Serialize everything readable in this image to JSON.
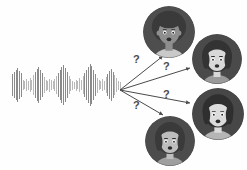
{
  "scene": {
    "title": "speaker-diarization-illustration",
    "canvas": {
      "width": 247,
      "height": 170,
      "background": "#ffffff"
    }
  },
  "waveform": {
    "label": "audio-waveform",
    "bar_color": "#8a8a8a",
    "bar_color_light": "#b8b8b8",
    "x": 12,
    "y": 85,
    "width": 106,
    "max_height": 42,
    "bar_count": 62,
    "bar_heights": [
      22,
      26,
      30,
      34,
      28,
      24,
      10,
      8,
      12,
      9,
      14,
      10,
      20,
      26,
      32,
      36,
      30,
      24,
      16,
      11,
      9,
      13,
      10,
      8,
      12,
      18,
      24,
      30,
      36,
      40,
      34,
      26,
      18,
      12,
      9,
      7,
      11,
      8,
      14,
      10,
      18,
      24,
      30,
      36,
      42,
      38,
      30,
      22,
      15,
      10,
      8,
      12,
      9,
      16,
      22,
      28,
      32,
      26,
      20,
      14,
      9,
      7
    ]
  },
  "arrows": {
    "label": "prediction-arrows",
    "color": "#4a4a4a",
    "origin": {
      "x": 120,
      "y": 90
    },
    "items": [
      {
        "name": "arrow-to-speaker-1",
        "to_x": 163,
        "to_y": 56,
        "marker": "?",
        "marker_x": 133,
        "marker_y": 54
      },
      {
        "name": "arrow-to-speaker-2",
        "to_x": 190,
        "to_y": 68,
        "marker": "?",
        "marker_x": 163,
        "marker_y": 61
      },
      {
        "name": "arrow-to-speaker-3",
        "to_x": 190,
        "to_y": 103,
        "marker": "?",
        "marker_x": 163,
        "marker_y": 89
      },
      {
        "name": "arrow-to-speaker-4",
        "to_x": 163,
        "to_y": 115,
        "marker": "?",
        "marker_x": 133,
        "marker_y": 100
      }
    ]
  },
  "speakers": [
    {
      "name": "speaker-avatar-1",
      "x": 143,
      "y": 6,
      "size": 52,
      "hair": "afro",
      "hair_color": "#3a3a3a",
      "skin_color": "#8e8e8e",
      "shirt_color": "#c9c9c9",
      "bg_color": "#4e4e4e"
    },
    {
      "name": "speaker-avatar-2",
      "x": 192,
      "y": 34,
      "size": 50,
      "hair": "bob",
      "hair_color": "#333333",
      "skin_color": "#d8d8d8",
      "shirt_color": "#9a9a9a",
      "bg_color": "#4a4a4a"
    },
    {
      "name": "speaker-avatar-3",
      "x": 192,
      "y": 88,
      "size": 52,
      "hair": "bob-fringe",
      "hair_color": "#2f2f2f",
      "skin_color": "#dcdcdc",
      "shirt_color": "#b5b5b5",
      "bg_color": "#474747"
    },
    {
      "name": "speaker-avatar-4",
      "x": 145,
      "y": 116,
      "size": 50,
      "hair": "bob-fringe",
      "hair_color": "#3a3a3a",
      "skin_color": "#bdbdbd",
      "shirt_color": "#9f9f9f",
      "bg_color": "#4c4c4c"
    }
  ]
}
